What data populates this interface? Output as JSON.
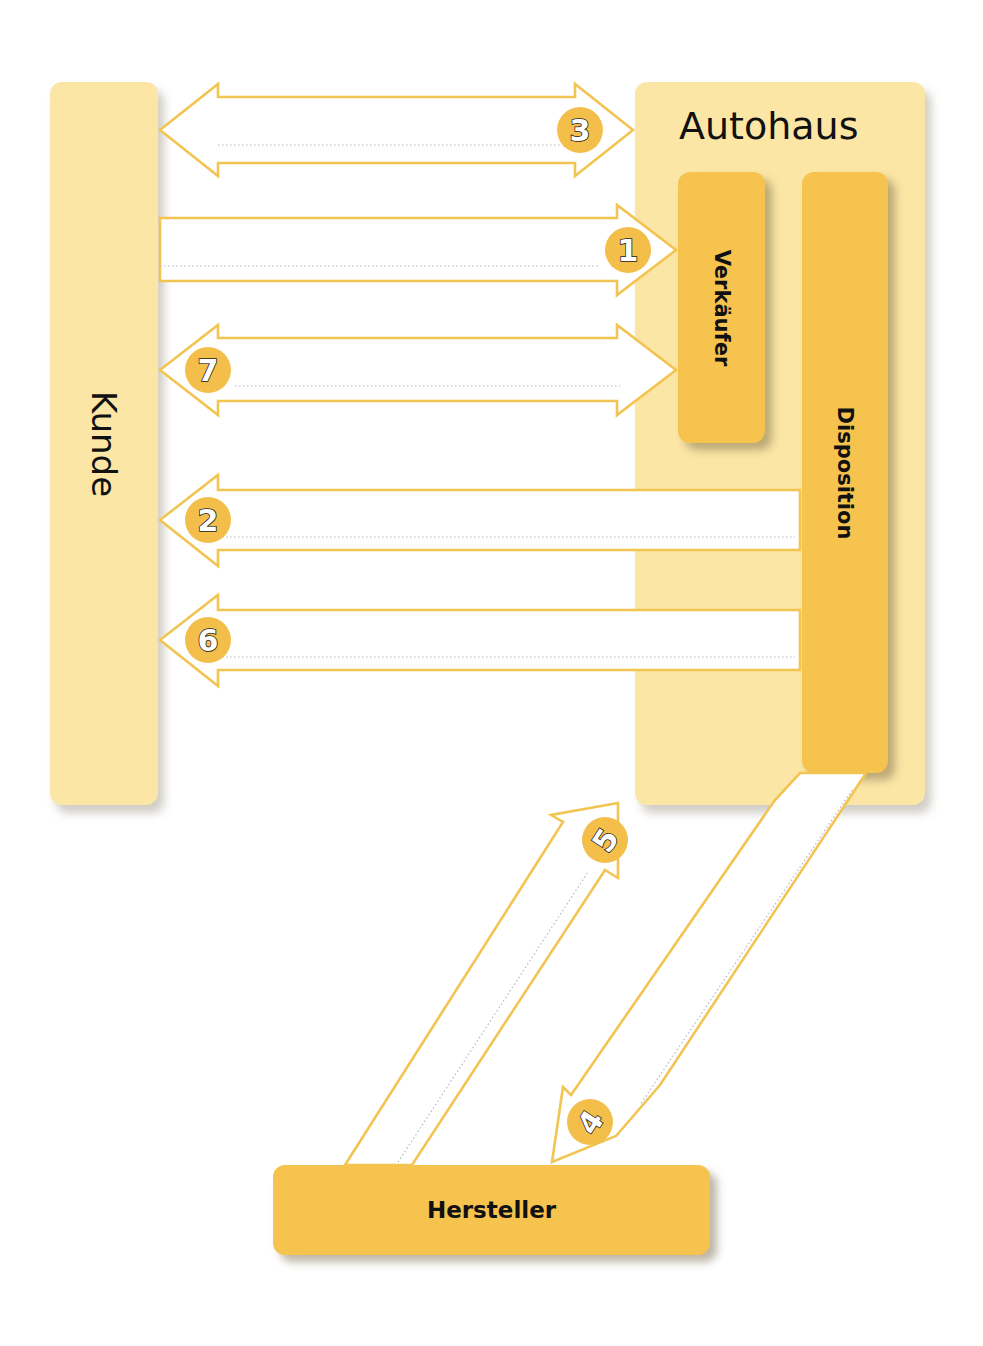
{
  "diagram": {
    "title": "Autohaus",
    "colors": {
      "light_box": "#fbe6a6",
      "dark_box": "#f5c34e",
      "arrow_outline": "#f2c452",
      "badge_fill": "#f3bf4a",
      "dotted_line": "#b7b7c8"
    },
    "nodes": {
      "kunde": {
        "label": "Kunde"
      },
      "autohaus": {
        "label": "Autohaus"
      },
      "verkaeufer": {
        "label": "Verkäufer"
      },
      "disposition": {
        "label": "Disposition"
      },
      "hersteller": {
        "label": "Hersteller"
      }
    },
    "arrows": [
      {
        "number": "1",
        "from": "Kunde",
        "to": "Verkäufer",
        "direction": "right"
      },
      {
        "number": "2",
        "from": "Disposition",
        "to": "Kunde",
        "direction": "left"
      },
      {
        "number": "3",
        "from": "Kunde",
        "to": "Autohaus",
        "direction": "both"
      },
      {
        "number": "4",
        "from": "Disposition",
        "to": "Hersteller",
        "direction": "down-left"
      },
      {
        "number": "5",
        "from": "Hersteller",
        "to": "Autohaus",
        "direction": "up-right"
      },
      {
        "number": "6",
        "from": "Disposition",
        "to": "Kunde",
        "direction": "left"
      },
      {
        "number": "7",
        "from": "Verkäufer",
        "to": "Kunde",
        "direction": "both"
      }
    ]
  }
}
